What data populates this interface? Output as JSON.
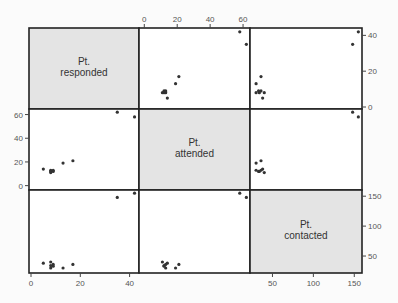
{
  "chart_data": {
    "type": "scatter",
    "subtype": "scatterplot-matrix",
    "title": "",
    "variables": [
      {
        "key": "responded",
        "label_lines": [
          "Pt.",
          "responded"
        ],
        "range": [
          0,
          43
        ],
        "ticks": [
          0,
          20,
          40
        ]
      },
      {
        "key": "attended",
        "label_lines": [
          "Pt.",
          "attended"
        ],
        "range": [
          -2,
          63
        ],
        "ticks": [
          0,
          20,
          40,
          60
        ]
      },
      {
        "key": "contacted",
        "label_lines": [
          "Pt.",
          "contacted"
        ],
        "range": [
          25,
          157
        ],
        "ticks": [
          50,
          100,
          150
        ]
      }
    ],
    "axes": {
      "top": {
        "variable": "attended",
        "ticks": [
          0,
          20,
          40,
          60
        ]
      },
      "bottom_left": {
        "variable": "responded",
        "ticks": [
          0,
          20,
          40
        ]
      },
      "bottom_right": {
        "variable": "contacted",
        "ticks": [
          50,
          100,
          150
        ]
      },
      "left": {
        "variable": "attended",
        "ticks": [
          0,
          20,
          40,
          60
        ]
      },
      "right_top": {
        "variable": "responded",
        "ticks": [
          0,
          20,
          40
        ]
      },
      "right_bottom": {
        "variable": "contacted",
        "ticks": [
          50,
          100,
          150
        ]
      }
    },
    "points": [
      {
        "responded": 5,
        "attended": 14,
        "contacted": 38
      },
      {
        "responded": 8,
        "attended": 13,
        "contacted": 30
      },
      {
        "responded": 8,
        "attended": 12,
        "contacted": 34
      },
      {
        "responded": 8,
        "attended": 11,
        "contacted": 40
      },
      {
        "responded": 9,
        "attended": 12,
        "contacted": 33
      },
      {
        "responded": 9,
        "attended": 13,
        "contacted": 36
      },
      {
        "responded": 13,
        "attended": 19,
        "contacted": 30
      },
      {
        "responded": 17,
        "attended": 21,
        "contacted": 36
      },
      {
        "responded": 35,
        "attended": 62,
        "contacted": 148
      },
      {
        "responded": 42,
        "attended": 58,
        "contacted": 155
      }
    ],
    "grid": false,
    "diagonal_fill": "#e4e4e4",
    "point_color": "#333333"
  }
}
